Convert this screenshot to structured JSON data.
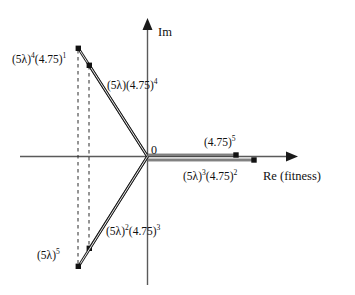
{
  "figure": {
    "type": "complex-plane-vector-diagram",
    "background": "#ffffff",
    "ink_color": "#1a1a1a",
    "axis_color": "#555555",
    "width": 355,
    "height": 295
  },
  "axes": {
    "real": {
      "label": "Re (fitness)",
      "label_parts": {
        "symbol": "Re",
        "qualifier": "(fitness)"
      },
      "arrow": "right"
    },
    "imaginary": {
      "label": "Im",
      "arrow": "up"
    },
    "origin": {
      "label": "0"
    }
  },
  "vectors": [
    {
      "id": "v-5lambda4-475-1",
      "label_base_a": "(5λ)",
      "label_exp_a": "4",
      "label_base_b": "(4.75)",
      "label_exp_b": "1",
      "label_text": "(5λ)⁴(4.75)¹",
      "quadrant": "upper-left",
      "endpoint": {
        "x": 78,
        "y": 48
      },
      "marker": "square",
      "has_dashed_projection": true
    },
    {
      "id": "v-5lambda-475-4",
      "label_base_a": "(5λ)",
      "label_exp_a": "",
      "label_base_b": "(4.75)",
      "label_exp_b": "4",
      "label_text": "(5λ)(4.75)⁴",
      "quadrant": "upper-left",
      "endpoint": {
        "x": 89,
        "y": 65
      },
      "marker": "square",
      "has_dashed_projection": true
    },
    {
      "id": "v-475-5",
      "label_base_a": "",
      "label_exp_a": "",
      "label_base_b": "(4.75)",
      "label_exp_b": "5",
      "label_text": "(4.75)⁵",
      "quadrant": "positive-real",
      "endpoint": {
        "x": 236,
        "y": 155
      },
      "marker": "square",
      "has_dashed_projection": false
    },
    {
      "id": "v-5lambda3-475-2",
      "label_base_a": "(5λ)",
      "label_exp_a": "3",
      "label_base_b": "(4.75)",
      "label_exp_b": "2",
      "label_text": "(5λ)³(4.75)²",
      "quadrant": "positive-real",
      "endpoint": {
        "x": 254,
        "y": 160
      },
      "marker": "square",
      "has_dashed_projection": false
    },
    {
      "id": "v-5lambda2-475-3",
      "label_base_a": "(5λ)",
      "label_exp_a": "2",
      "label_base_b": "(4.75)",
      "label_exp_b": "3",
      "label_text": "(5λ)²(4.75)³",
      "quadrant": "lower-left",
      "endpoint": {
        "x": 89,
        "y": 248
      },
      "marker": "square",
      "has_dashed_projection": true
    },
    {
      "id": "v-5lambda5",
      "label_base_a": "(5λ)",
      "label_exp_a": "5",
      "label_base_b": "",
      "label_exp_b": "",
      "label_text": "(5λ)⁵",
      "quadrant": "lower-left",
      "endpoint": {
        "x": 78,
        "y": 266
      },
      "marker": "square",
      "has_dashed_projection": true
    }
  ]
}
